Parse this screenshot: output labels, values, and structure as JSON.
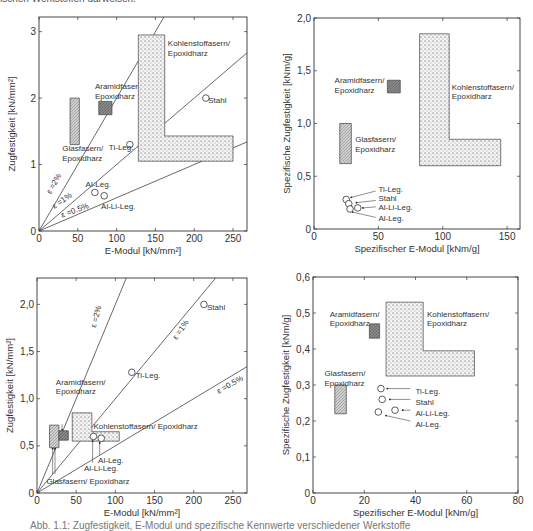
{
  "page": {
    "top_caption": "ischen Werkstoffen darweisen.",
    "bottom_caption": "Abb. 1.1: Zugfestigkeit, E-Modul und spezifische Kennwerte verschiedener Werkstoffe"
  },
  "chart_data": [
    {
      "id": "tl",
      "type": "scatter",
      "title": "",
      "xlabel": "E-Modul [kN/mm²]",
      "ylabel": "Zugfestigkeit [kN/mm²]",
      "xlim": [
        0,
        268
      ],
      "ylim": [
        0,
        3.22
      ],
      "xticks": [
        0,
        50,
        100,
        150,
        200,
        250
      ],
      "xtick_labels": [
        "0",
        "50",
        "100",
        "150",
        "200",
        "250"
      ],
      "yticks": [
        0,
        1,
        2,
        3
      ],
      "ytick_labels": [
        "0",
        "1",
        "2",
        "3"
      ],
      "grid": false,
      "frame": {
        "left": 39,
        "right": 247,
        "top": 17,
        "bottom": 231
      },
      "strain_lines": [
        {
          "name": "ε =2%",
          "slope": 0.02,
          "label_pos": [
            15,
            0.55
          ],
          "label_angle": -60
        },
        {
          "name": "ε =1%",
          "slope": 0.01,
          "label_pos": [
            20,
            0.33
          ],
          "label_angle": -35
        },
        {
          "name": "ε =0.5%",
          "slope": 0.005,
          "label_pos": [
            30,
            0.2
          ],
          "label_angle": -20
        }
      ],
      "regions": [
        {
          "name": "Glasfasern/Epoxidharz",
          "pattern": "hatch",
          "polygon": [
            [
              40,
              1.3
            ],
            [
              52,
              1.3
            ],
            [
              52,
              2.0
            ],
            [
              40,
              2.0
            ]
          ],
          "label": [
            "Glasfasern/",
            "Epoxidharz"
          ],
          "label_xy": [
            30,
            1.2
          ]
        },
        {
          "name": "Aramidfasern/Epoxidharz",
          "pattern": "dark",
          "polygon": [
            [
              77,
              1.75
            ],
            [
              94,
              1.75
            ],
            [
              94,
              1.95
            ],
            [
              77,
              1.95
            ]
          ],
          "label": [
            "Aramidfasern/",
            "Epoxidharz"
          ],
          "label_xy": [
            72,
            2.13
          ]
        },
        {
          "name": "Kohlenstoffasern/Epoxidharz",
          "pattern": "dots",
          "polygon": [
            [
              128,
              1.05
            ],
            [
              250,
              1.05
            ],
            [
              250,
              1.43
            ],
            [
              162,
              1.43
            ],
            [
              162,
              2.95
            ],
            [
              128,
              2.95
            ]
          ],
          "label": [
            "Kohlenstoffasern/",
            "Epoxidharz"
          ],
          "label_xy": [
            166,
            2.78
          ]
        }
      ],
      "points": [
        {
          "name": "Stahl",
          "x": 215,
          "y": 2.0,
          "label": "Stahl",
          "label_xy": [
            218,
            1.97
          ]
        },
        {
          "name": "Ti-Leg.",
          "x": 117,
          "y": 1.3,
          "label": "Ti-Leg.",
          "label_xy": [
            90,
            1.27
          ]
        },
        {
          "name": "Al-Leg.",
          "x": 72,
          "y": 0.58,
          "label": "Al-Leg.",
          "label_xy": [
            60,
            0.7
          ]
        },
        {
          "name": "Al-Li-Leg.",
          "x": 84,
          "y": 0.53,
          "label": "Al-Li-Leg.",
          "label_xy": [
            80,
            0.38
          ]
        }
      ],
      "pointers": []
    },
    {
      "id": "tr",
      "type": "scatter",
      "title": "",
      "xlabel": "Spezifischer E-Modul [kNm/g]",
      "ylabel": "Spezifische Zugfestigkeit [kNm/g]",
      "xlim": [
        0,
        160
      ],
      "ylim": [
        0,
        2.0
      ],
      "xticks": [
        0,
        50,
        100,
        150
      ],
      "xtick_labels": [
        "0",
        "50",
        "100",
        "150"
      ],
      "yticks": [
        0,
        0.5,
        1.0,
        1.5,
        2.0
      ],
      "ytick_labels": [
        "0",
        "0,5",
        "1,0",
        "1,5",
        "2,0"
      ],
      "grid": false,
      "frame": {
        "left": 314,
        "right": 520,
        "top": 18,
        "bottom": 229
      },
      "strain_lines": [],
      "regions": [
        {
          "name": "Glasfasern/Epoxidharz",
          "pattern": "hatch",
          "polygon": [
            [
              20,
              0.62
            ],
            [
              29,
              0.62
            ],
            [
              29,
              1.0
            ],
            [
              20,
              1.0
            ]
          ],
          "label": [
            "Glasfasern/",
            "Epoxidharz"
          ],
          "label_xy": [
            32,
            0.82
          ]
        },
        {
          "name": "Aramidfasern/Epoxidharz",
          "pattern": "dark",
          "polygon": [
            [
              57,
              1.29
            ],
            [
              67,
              1.29
            ],
            [
              67,
              1.41
            ],
            [
              57,
              1.41
            ]
          ],
          "label": [
            "Aramidfasern/",
            "Epoxidharz"
          ],
          "label_xy": [
            16,
            1.38
          ]
        },
        {
          "name": "Kohlenstoffasern/Epoxidharz",
          "pattern": "dots",
          "polygon": [
            [
              82,
              0.6
            ],
            [
              145,
              0.6
            ],
            [
              145,
              0.85
            ],
            [
              105,
              0.85
            ],
            [
              105,
              1.85
            ],
            [
              82,
              1.85
            ]
          ],
          "label": [
            "Kohlenstoffasern/",
            "Epoxidharz"
          ],
          "label_xy": [
            107,
            1.32
          ]
        }
      ],
      "points": [
        {
          "name": "Ti-Leg.",
          "x": 25,
          "y": 0.28,
          "label": "Ti-Leg.",
          "label_xy": [
            50,
            0.38
          ]
        },
        {
          "name": "Stahl",
          "x": 27,
          "y": 0.24,
          "label": "Stahl",
          "label_xy": [
            50,
            0.29
          ]
        },
        {
          "name": "Al-Li-Leg.",
          "x": 34,
          "y": 0.2,
          "label": "Al-Li-Leg.",
          "label_xy": [
            50,
            0.21
          ]
        },
        {
          "name": "Al-Leg.",
          "x": 28,
          "y": 0.19,
          "label": "Al-Leg.",
          "label_xy": [
            50,
            0.1
          ]
        }
      ],
      "pointers": [
        {
          "from": [
            48,
            0.36
          ],
          "to": [
            29,
            0.3
          ]
        },
        {
          "from": [
            48,
            0.27
          ],
          "to": [
            33,
            0.25
          ]
        },
        {
          "from": [
            48,
            0.21
          ],
          "to": [
            38,
            0.2
          ]
        },
        {
          "from": [
            48,
            0.11
          ],
          "to": [
            30,
            0.16
          ]
        }
      ]
    },
    {
      "id": "bl",
      "type": "scatter",
      "title": "",
      "xlabel": "E-Modul [kN/mm²]",
      "ylabel": "Zugfestigkeit [kN/mm²]",
      "xlim": [
        0,
        268
      ],
      "ylim": [
        0,
        2.28
      ],
      "xticks": [
        0,
        50,
        100,
        150,
        200,
        250
      ],
      "xtick_labels": [
        "0",
        "50",
        "100",
        "150",
        "200",
        "250"
      ],
      "yticks": [
        0,
        0.5,
        1.0,
        1.5,
        2.0
      ],
      "ytick_labels": [
        "0",
        "0,5",
        "1,0",
        "1,5",
        "2,0"
      ],
      "grid": false,
      "frame": {
        "left": 37,
        "right": 247,
        "top": 278,
        "bottom": 493
      },
      "strain_lines": [
        {
          "name": "ε =2%",
          "slope": 0.02,
          "label_pos": [
            75,
            1.75
          ],
          "label_angle": -75
        },
        {
          "name": "ε =1%",
          "slope": 0.01,
          "label_pos": [
            178,
            1.62
          ],
          "label_angle": -55
        },
        {
          "name": "ε =0.5%",
          "slope": 0.005,
          "label_pos": [
            232,
            1.05
          ],
          "label_angle": -30
        }
      ],
      "regions": [
        {
          "name": "Glasfasern/Epoxidharz",
          "pattern": "hatch",
          "polygon": [
            [
              16,
              0.48
            ],
            [
              28,
              0.48
            ],
            [
              28,
              0.72
            ],
            [
              16,
              0.72
            ]
          ],
          "label": [
            "Glasfasern/ Epoxidharz"
          ],
          "label_xy": [
            12,
            0.1
          ]
        },
        {
          "name": "Aramidfasern/Epoxidharz",
          "pattern": "dark",
          "polygon": [
            [
              28,
              0.56
            ],
            [
              40,
              0.56
            ],
            [
              40,
              0.66
            ],
            [
              28,
              0.66
            ]
          ],
          "label": [
            "Aramidfasern/",
            "Epoxidharz"
          ],
          "label_xy": [
            24,
            1.15
          ]
        },
        {
          "name": "Kohlenstoffasern/Epoxidharz",
          "pattern": "dots",
          "polygon": [
            [
              45,
              0.55
            ],
            [
              105,
              0.55
            ],
            [
              105,
              0.65
            ],
            [
              70,
              0.65
            ],
            [
              70,
              0.85
            ],
            [
              45,
              0.85
            ]
          ],
          "label": [
            "Kohlenstoffasern/ Epoxidharz"
          ],
          "label_xy": [
            72,
            0.68
          ]
        }
      ],
      "points": [
        {
          "name": "Stahl",
          "x": 213,
          "y": 2.0,
          "label": "Stahl",
          "label_xy": [
            217,
            1.97
          ]
        },
        {
          "name": "Ti-Leg.",
          "x": 121,
          "y": 1.28,
          "label": "Ti-Leg.",
          "label_xy": [
            126,
            1.25
          ]
        },
        {
          "name": "Al-Li-Leg.",
          "x": 72,
          "y": 0.6,
          "label": "Al-Li-Leg.",
          "label_xy": [
            60,
            0.27
          ]
        },
        {
          "name": "Al-Leg.",
          "x": 82,
          "y": 0.58,
          "label": "Al-Leg.",
          "label_xy": [
            78,
            0.35
          ]
        }
      ],
      "pointers": [
        {
          "from": [
            32,
            0.73
          ],
          "to": [
            32,
            0.67
          ]
        },
        {
          "from": [
            20,
            0.2
          ],
          "to": [
            20,
            0.47
          ]
        },
        {
          "from": [
            23,
            0.2
          ],
          "to": [
            23,
            0.47
          ]
        },
        {
          "from": [
            71,
            0.32
          ],
          "to": [
            71,
            0.55
          ]
        },
        {
          "from": [
            80,
            0.4
          ],
          "to": [
            80,
            0.53
          ]
        }
      ]
    },
    {
      "id": "br",
      "type": "scatter",
      "title": "",
      "xlabel": "Spezifischer E-Modul [kNm/g]",
      "ylabel": "Spezifische Zugfestigkeit [kNm/g]",
      "xlim": [
        0,
        80
      ],
      "ylim": [
        0,
        0.6
      ],
      "xticks": [
        0,
        20,
        40,
        60,
        80
      ],
      "xtick_labels": [
        "0",
        "20",
        "40",
        "60",
        "80"
      ],
      "yticks": [
        0,
        0.1,
        0.2,
        0.3,
        0.4,
        0.5,
        0.6
      ],
      "ytick_labels": [
        "0",
        "0,1",
        "0,2",
        "0,3",
        "0,4",
        "0,5",
        "0,6"
      ],
      "grid": false,
      "frame": {
        "left": 313,
        "right": 518,
        "top": 277,
        "bottom": 493
      },
      "strain_lines": [],
      "regions": [
        {
          "name": "Glasfasern/Epoxidharz",
          "pattern": "hatch",
          "polygon": [
            [
              8.5,
              0.22
            ],
            [
              13,
              0.22
            ],
            [
              13,
              0.3
            ],
            [
              8.5,
              0.3
            ]
          ],
          "label": [
            "Glasfasern/",
            "Epoxidharz"
          ],
          "label_xy": [
            4.5,
            0.325
          ]
        },
        {
          "name": "Aramidfasern/Epoxidharz",
          "pattern": "dark",
          "polygon": [
            [
              22,
              0.43
            ],
            [
              26,
              0.43
            ],
            [
              26,
              0.47
            ],
            [
              22,
              0.47
            ]
          ],
          "label": [
            "Aramidfasern/",
            "Epoxidharz"
          ],
          "label_xy": [
            6.5,
            0.49
          ]
        },
        {
          "name": "Kohlenstoffasern/Epoxidharz",
          "pattern": "dots",
          "polygon": [
            [
              28.5,
              0.325
            ],
            [
              63,
              0.325
            ],
            [
              63,
              0.395
            ],
            [
              43,
              0.395
            ],
            [
              43,
              0.53
            ],
            [
              28.5,
              0.53
            ]
          ],
          "label": [
            "Kohlenstoffasern/",
            "Epoxidharz"
          ],
          "label_xy": [
            44.5,
            0.49
          ]
        }
      ],
      "points": [
        {
          "name": "Ti-Leg.",
          "x": 26.5,
          "y": 0.29,
          "label": "Ti-Leg.",
          "label_xy": [
            40,
            0.283
          ]
        },
        {
          "name": "Stahl",
          "x": 27,
          "y": 0.26,
          "label": "Stahl",
          "label_xy": [
            40,
            0.252
          ]
        },
        {
          "name": "Al-Li-Leg.",
          "x": 32,
          "y": 0.23,
          "label": "Al-Li-Leg.",
          "label_xy": [
            40,
            0.222
          ]
        },
        {
          "name": "Al-Leg.",
          "x": 25.5,
          "y": 0.225,
          "label": "Al-Leg.",
          "label_xy": [
            40,
            0.192
          ]
        }
      ],
      "pointers": [
        {
          "from": [
            38,
            0.29
          ],
          "to": [
            29,
            0.29
          ]
        },
        {
          "from": [
            38,
            0.26
          ],
          "to": [
            30,
            0.26
          ]
        },
        {
          "from": [
            38,
            0.23
          ],
          "to": [
            35,
            0.23
          ]
        },
        {
          "from": [
            38,
            0.2
          ],
          "to": [
            28.5,
            0.215
          ]
        }
      ]
    }
  ]
}
